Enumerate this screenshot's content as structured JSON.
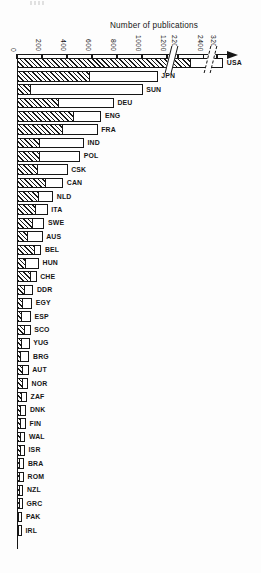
{
  "figure": {
    "title": "Number of publications"
  },
  "chart_data": {
    "type": "bar",
    "orientation": "horizontal",
    "title": "Number of publications",
    "xlabel": "Number of publications",
    "ylabel": "Country",
    "legend": "none",
    "grid": false,
    "axis": {
      "ticks": [
        0,
        200,
        400,
        600,
        800,
        1000,
        1200,
        2200,
        2400,
        3200
      ],
      "breaks": [
        [
          1200,
          2200
        ],
        [
          2400,
          3200
        ]
      ],
      "arrow_end": true
    },
    "series_styles": [
      {
        "name": "hatched-segment",
        "style": "diagonal-hatch"
      },
      {
        "name": "open-segment",
        "style": "open-white"
      }
    ],
    "countries": [
      {
        "code": "USA",
        "hatched": 2300,
        "total": 3250
      },
      {
        "code": "JPN",
        "hatched": 590,
        "total": 1125
      },
      {
        "code": "SUN",
        "hatched": 115,
        "total": 1005
      },
      {
        "code": "DEU",
        "hatched": 340,
        "total": 775
      },
      {
        "code": "ENG",
        "hatched": 455,
        "total": 675
      },
      {
        "code": "FRA",
        "hatched": 370,
        "total": 645
      },
      {
        "code": "IND",
        "hatched": 185,
        "total": 535
      },
      {
        "code": "POL",
        "hatched": 190,
        "total": 505
      },
      {
        "code": "CSK",
        "hatched": 170,
        "total": 405
      },
      {
        "code": "CAN",
        "hatched": 235,
        "total": 370
      },
      {
        "code": "NLD",
        "hatched": 175,
        "total": 290
      },
      {
        "code": "ITA",
        "hatched": 155,
        "total": 245
      },
      {
        "code": "SWE",
        "hatched": 130,
        "total": 220
      },
      {
        "code": "AUS",
        "hatched": 90,
        "total": 205
      },
      {
        "code": "BEL",
        "hatched": 150,
        "total": 195
      },
      {
        "code": "HUN",
        "hatched": 75,
        "total": 176
      },
      {
        "code": "CHE",
        "hatched": 115,
        "total": 157
      },
      {
        "code": "DDR",
        "hatched": 70,
        "total": 131
      },
      {
        "code": "EGY",
        "hatched": 50,
        "total": 122
      },
      {
        "code": "ESP",
        "hatched": 45,
        "total": 112
      },
      {
        "code": "SCO",
        "hatched": 64,
        "total": 109
      },
      {
        "code": "YUG",
        "hatched": 45,
        "total": 101
      },
      {
        "code": "BRG",
        "hatched": 32,
        "total": 100
      },
      {
        "code": "AUT",
        "hatched": 48,
        "total": 93
      },
      {
        "code": "NOR",
        "hatched": 48,
        "total": 88
      },
      {
        "code": "ZAF",
        "hatched": 40,
        "total": 80
      },
      {
        "code": "DNK",
        "hatched": 37,
        "total": 75
      },
      {
        "code": "FIN",
        "hatched": 37,
        "total": 72
      },
      {
        "code": "WAL",
        "hatched": 35,
        "total": 67
      },
      {
        "code": "ISR",
        "hatched": 32,
        "total": 64
      },
      {
        "code": "BRA",
        "hatched": 29,
        "total": 59
      },
      {
        "code": "ROM",
        "hatched": 27,
        "total": 56
      },
      {
        "code": "NZL",
        "hatched": 24,
        "total": 51
      },
      {
        "code": "GRC",
        "hatched": 24,
        "total": 48
      },
      {
        "code": "PAK",
        "hatched": 19,
        "total": 43
      },
      {
        "code": "IRL",
        "hatched": 19,
        "total": 40
      }
    ]
  }
}
